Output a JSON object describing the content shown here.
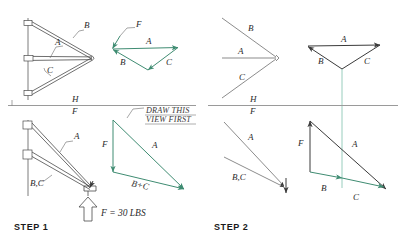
{
  "drawing": {
    "title": "Graphical vector analysis of a wall bracket truss",
    "colors": {
      "vector_green": "#3f8c72",
      "projector_green": "#7fc0ac",
      "line_black": "#3a3a3a",
      "reference_line": "#9a9a9a",
      "paper": "#ffffff"
    }
  },
  "steps": [
    {
      "id": "step1",
      "label": "STEP 1"
    },
    {
      "id": "step2",
      "label": "STEP 2"
    }
  ],
  "reference_line": {
    "above_label": "H",
    "below_label": "F",
    "description": "horizontal-fold-line between top view and front view"
  },
  "step1": {
    "top_view": {
      "name": "truss-top-view",
      "members": [
        {
          "id": "B",
          "label": "B"
        },
        {
          "id": "A",
          "label": "A"
        },
        {
          "id": "C",
          "label": "C"
        }
      ],
      "reference": {
        "above_label": "H",
        "below_label": "F"
      }
    },
    "top_vector": {
      "name": "force-polygon-top-view",
      "color": "#3f8c72",
      "labels": [
        {
          "id": "F",
          "label": "F"
        },
        {
          "id": "A",
          "label": "A"
        },
        {
          "id": "B",
          "label": "B"
        },
        {
          "id": "C",
          "label": "C"
        }
      ]
    },
    "front_view": {
      "name": "truss-front-view",
      "members": [
        {
          "id": "A",
          "label": "A"
        },
        {
          "id": "BC",
          "label": "B,C"
        }
      ],
      "load": {
        "label": "F = 30 LBS",
        "direction": "up"
      }
    },
    "front_vector": {
      "name": "force-polygon-front-view",
      "color": "#3f8c72",
      "labels": [
        {
          "id": "F",
          "label": "F"
        },
        {
          "id": "A",
          "label": "A"
        },
        {
          "id": "BC",
          "label": "B+C"
        }
      ],
      "note": {
        "line1": "DRAW THIS",
        "line2": "VIEW FIRST"
      }
    }
  },
  "step2": {
    "top_view": {
      "name": "truss-top-view-step2",
      "members": [
        {
          "id": "B",
          "label": "B"
        },
        {
          "id": "A",
          "label": "A"
        },
        {
          "id": "C",
          "label": "C"
        }
      ],
      "reference": {
        "above_label": "H",
        "below_label": "F"
      }
    },
    "top_vector": {
      "name": "force-polygon-top-view-step2",
      "color": "#3a3a3a",
      "labels": [
        {
          "id": "A",
          "label": "A"
        },
        {
          "id": "B",
          "label": "B"
        },
        {
          "id": "C",
          "label": "C"
        }
      ]
    },
    "front_view": {
      "name": "truss-front-view-step2",
      "members": [
        {
          "id": "A",
          "label": "A"
        },
        {
          "id": "BC",
          "label": "B,C"
        }
      ]
    },
    "front_vector": {
      "name": "force-polygon-front-view-step2",
      "labels": [
        {
          "id": "F",
          "label": "F"
        },
        {
          "id": "A",
          "label": "A"
        },
        {
          "id": "B",
          "label": "B"
        },
        {
          "id": "C",
          "label": "C"
        }
      ]
    }
  }
}
